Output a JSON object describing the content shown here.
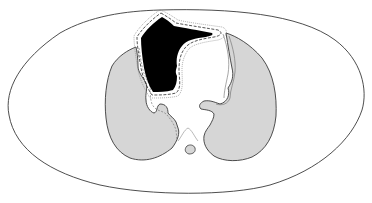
{
  "diagram": {
    "type": "anatomical-cross-section",
    "colors": {
      "background": "#ffffff",
      "outline": "#3a3a3a",
      "lung_fill": "#d6d6d6",
      "mass_fill": "#000000",
      "dashed_margin": "#2a2a2a",
      "pleura_line": "#9a9a9a"
    },
    "regions": [
      {
        "id": "body-outline",
        "fill": "none"
      },
      {
        "id": "right-lung",
        "fill": "lung"
      },
      {
        "id": "left-lung",
        "fill": "lung"
      },
      {
        "id": "mediastinal-mass",
        "fill": "black"
      },
      {
        "id": "target-margin",
        "style": "dashed"
      },
      {
        "id": "spinal-canal",
        "fill": "lung"
      }
    ]
  }
}
